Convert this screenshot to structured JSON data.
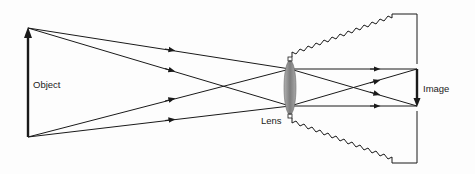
{
  "diagram": {
    "labels": {
      "object": "Object",
      "lens": "Lens",
      "image": "Image"
    },
    "colors": {
      "line": "#1a1a1a",
      "lens": "#8a8a8a",
      "background": "#fdfdfd"
    }
  }
}
